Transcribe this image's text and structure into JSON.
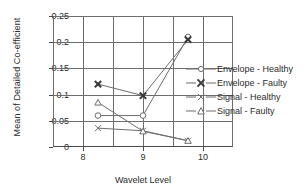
{
  "chart_data": {
    "type": "line",
    "title": "",
    "xlabel": "Wavelet Level",
    "ylabel": "Mean of Detailed Co-efficient",
    "categories": [
      "8",
      "9",
      "10"
    ],
    "x": [
      8,
      9,
      10
    ],
    "ylim": [
      0,
      0.25
    ],
    "yticks": [
      "0",
      "0.05",
      "0.1",
      "0.15",
      "0.2",
      "0.25"
    ],
    "ytick_values": [
      0,
      0.05,
      0.1,
      0.15,
      0.2,
      0.25
    ],
    "grid": true,
    "legend_position": "right-inside",
    "series": [
      {
        "name": "Envelope - Healthy",
        "marker": "circle",
        "values": [
          0.06,
          0.06,
          0.21
        ]
      },
      {
        "name": "Envelope - Faulty",
        "marker": "bold-x",
        "values": [
          0.12,
          0.098,
          0.205
        ]
      },
      {
        "name": "Signal - Healthy",
        "marker": "thin-x",
        "values": [
          0.036,
          0.031,
          0.012
        ]
      },
      {
        "name": "Signal - Faulty",
        "marker": "triangle",
        "values": [
          0.085,
          0.03,
          0.012
        ]
      }
    ]
  },
  "legend": {
    "items": [
      {
        "label": "Envelope - Healthy"
      },
      {
        "label": "Envelope - Faulty"
      },
      {
        "label": "Signal - Healthy"
      },
      {
        "label": "Signal - Faulty"
      }
    ]
  },
  "colors": {
    "line": "#6d6d6d",
    "axis": "#4a4a4a",
    "text": "#2b2b2b",
    "background": "#ffffff"
  }
}
